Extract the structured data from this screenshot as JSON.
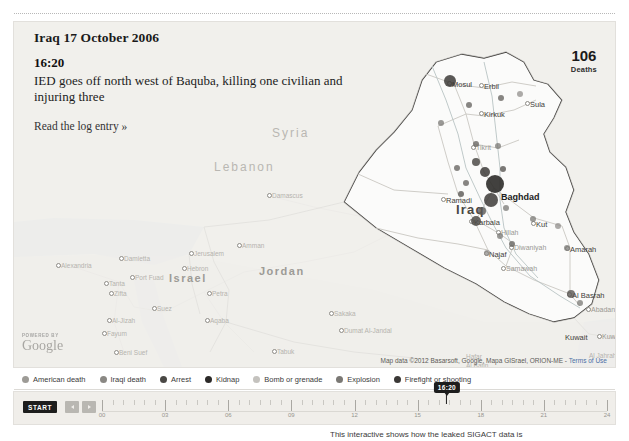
{
  "header": {
    "title": "Iraq 17 October 2006",
    "time": "16:20",
    "description": "IED goes off north west of Baquba, killing one civilian and injuring three",
    "link_label": "Read the log entry »"
  },
  "counter": {
    "value": "106",
    "label": "Deaths"
  },
  "map": {
    "attribution": "Map data ©2012 Basarsoft, Google, Mapa GISrael, ORION-ME",
    "terms_label": "Terms of Use",
    "google_powered_by": "POWERED BY",
    "google_wordmark": "Google",
    "countries": [
      {
        "name": "Syria",
        "x": 258,
        "y": 104,
        "style": "country-faint"
      },
      {
        "name": "Lebanon",
        "x": 200,
        "y": 138,
        "style": "country-faint"
      },
      {
        "name": "Israel",
        "x": 155,
        "y": 250,
        "style": "country-mid"
      },
      {
        "name": "Jordan",
        "x": 245,
        "y": 243,
        "style": "country-mid"
      },
      {
        "name": "Iraq",
        "x": 442,
        "y": 180,
        "style": "country-dark"
      },
      {
        "name": "Kuwait",
        "x": 551,
        "y": 311,
        "style": "city-dark"
      }
    ],
    "cities": [
      {
        "name": "Mosul",
        "x": 438,
        "y": 58,
        "style": "city-dark",
        "dot": true
      },
      {
        "name": "Erbil",
        "x": 470,
        "y": 60,
        "style": "city-dark",
        "dot": true
      },
      {
        "name": "Sula",
        "x": 516,
        "y": 78,
        "style": "city-dark",
        "dot": true
      },
      {
        "name": "Kirkuk",
        "x": 470,
        "y": 88,
        "style": "city-dark",
        "dot": true
      },
      {
        "name": "Tikrit",
        "x": 462,
        "y": 122,
        "style": "city-mid",
        "dot": true
      },
      {
        "name": "Baghdad",
        "x": 487,
        "y": 170,
        "style": "city-big",
        "dot": false
      },
      {
        "name": "Ramadi",
        "x": 432,
        "y": 174,
        "style": "city-dark",
        "dot": true
      },
      {
        "name": "Karbala",
        "x": 460,
        "y": 196,
        "style": "city-dark",
        "dot": true
      },
      {
        "name": "Hillah",
        "x": 487,
        "y": 207,
        "style": "city-mid",
        "dot": true
      },
      {
        "name": "Kut",
        "x": 522,
        "y": 198,
        "style": "city-dark",
        "dot": true
      },
      {
        "name": "Diwaniyah",
        "x": 500,
        "y": 222,
        "style": "city-mid",
        "dot": true
      },
      {
        "name": "Najaf",
        "x": 475,
        "y": 228,
        "style": "city-dark",
        "dot": true
      },
      {
        "name": "Samawah",
        "x": 492,
        "y": 243,
        "style": "city-mid",
        "dot": true
      },
      {
        "name": "Amarah",
        "x": 556,
        "y": 223,
        "style": "city-dark",
        "dot": true
      },
      {
        "name": "Al Basrah",
        "x": 558,
        "y": 269,
        "style": "city-dark",
        "dot": true
      },
      {
        "name": "Abadan",
        "x": 577,
        "y": 284,
        "style": "city-mid",
        "dot": true
      },
      {
        "name": "Kuwa",
        "x": 588,
        "y": 311,
        "style": "city-mid",
        "dot": true
      },
      {
        "name": "Damascus",
        "x": 258,
        "y": 170,
        "style": "city-faint",
        "dot": true
      },
      {
        "name": "Amman",
        "x": 228,
        "y": 220,
        "style": "city-faint",
        "dot": true
      },
      {
        "name": "Jerusalem",
        "x": 180,
        "y": 228,
        "style": "city-faint",
        "dot": true
      },
      {
        "name": "Hebron",
        "x": 173,
        "y": 243,
        "style": "city-faint",
        "dot": true
      },
      {
        "name": "Petra",
        "x": 198,
        "y": 268,
        "style": "city-faint",
        "dot": true
      },
      {
        "name": "Aqaba",
        "x": 196,
        "y": 295,
        "style": "city-faint",
        "dot": true
      },
      {
        "name": "Alexandria",
        "x": 47,
        "y": 240,
        "style": "city-faint",
        "dot": true
      },
      {
        "name": "Damietta",
        "x": 110,
        "y": 233,
        "style": "city-faint",
        "dot": true
      },
      {
        "name": "Port Fuad",
        "x": 121,
        "y": 252,
        "style": "city-faint",
        "dot": true
      },
      {
        "name": "Tanta",
        "x": 95,
        "y": 258,
        "style": "city-faint",
        "dot": true
      },
      {
        "name": "Zifta",
        "x": 100,
        "y": 268,
        "style": "city-faint",
        "dot": true
      },
      {
        "name": "Suez",
        "x": 143,
        "y": 283,
        "style": "city-faint",
        "dot": true
      },
      {
        "name": "Al-Jizah",
        "x": 98,
        "y": 295,
        "style": "city-faint",
        "dot": true
      },
      {
        "name": "Fayum",
        "x": 93,
        "y": 308,
        "style": "city-faint",
        "dot": true
      },
      {
        "name": "Beni Suef",
        "x": 105,
        "y": 327,
        "style": "city-faint",
        "dot": true
      },
      {
        "name": "Tabuk",
        "x": 263,
        "y": 326,
        "style": "city-faint",
        "dot": true
      },
      {
        "name": "Dumat Al-Jandal",
        "x": 330,
        "y": 305,
        "style": "city-faint",
        "dot": true
      },
      {
        "name": "Sakaka",
        "x": 320,
        "y": 288,
        "style": "city-faint",
        "dot": true
      },
      {
        "name": "Hafar",
        "x": 452,
        "y": 331,
        "style": "city-faint",
        "dot": false
      },
      {
        "name": "Al Batin",
        "x": 452,
        "y": 340,
        "style": "city-faint",
        "dot": false
      },
      {
        "name": "Al Jahrah",
        "x": 575,
        "y": 330,
        "style": "city-faint",
        "dot": false
      }
    ],
    "incidents": [
      {
        "x": 436,
        "y": 59,
        "r": 6,
        "shade": "#3d3b38",
        "o": 0.85
      },
      {
        "x": 455,
        "y": 83,
        "r": 3,
        "shade": "#6a6864",
        "o": 0.8
      },
      {
        "x": 487,
        "y": 76,
        "r": 3,
        "shade": "#6a6864",
        "o": 0.8
      },
      {
        "x": 506,
        "y": 72,
        "r": 3,
        "shade": "#8a8884",
        "o": 0.7
      },
      {
        "x": 427,
        "y": 101,
        "r": 3,
        "shade": "#7a7874",
        "o": 0.75
      },
      {
        "x": 462,
        "y": 122,
        "r": 3,
        "shade": "#6a6864",
        "o": 0.8
      },
      {
        "x": 484,
        "y": 124,
        "r": 3,
        "shade": "#7a7874",
        "o": 0.75
      },
      {
        "x": 462,
        "y": 140,
        "r": 4,
        "shade": "#4d4b48",
        "o": 0.85
      },
      {
        "x": 443,
        "y": 146,
        "r": 3,
        "shade": "#6a6864",
        "o": 0.8
      },
      {
        "x": 471,
        "y": 150,
        "r": 5,
        "shade": "#3d3b38",
        "o": 0.85
      },
      {
        "x": 489,
        "y": 147,
        "r": 3,
        "shade": "#5a5854",
        "o": 0.8
      },
      {
        "x": 452,
        "y": 161,
        "r": 3,
        "shade": "#6a6864",
        "o": 0.8
      },
      {
        "x": 481,
        "y": 162,
        "r": 9,
        "shade": "#2e2c2a",
        "o": 0.9
      },
      {
        "x": 447,
        "y": 172,
        "r": 3,
        "shade": "#5a5854",
        "o": 0.8
      },
      {
        "x": 477,
        "y": 178,
        "r": 7,
        "shade": "#3d3b38",
        "o": 0.85
      },
      {
        "x": 468,
        "y": 189,
        "r": 4,
        "shade": "#5a5854",
        "o": 0.8
      },
      {
        "x": 462,
        "y": 199,
        "r": 5,
        "shade": "#4d4b48",
        "o": 0.85
      },
      {
        "x": 492,
        "y": 186,
        "r": 3,
        "shade": "#7a7874",
        "o": 0.75
      },
      {
        "x": 486,
        "y": 214,
        "r": 3,
        "shade": "#7a7874",
        "o": 0.75
      },
      {
        "x": 498,
        "y": 222,
        "r": 3,
        "shade": "#6a6864",
        "o": 0.8
      },
      {
        "x": 473,
        "y": 231,
        "r": 3,
        "shade": "#8a8884",
        "o": 0.7
      },
      {
        "x": 519,
        "y": 197,
        "r": 3,
        "shade": "#7a7874",
        "o": 0.75
      },
      {
        "x": 544,
        "y": 204,
        "r": 3,
        "shade": "#8a8884",
        "o": 0.7
      },
      {
        "x": 553,
        "y": 226,
        "r": 3,
        "shade": "#7a7874",
        "o": 0.75
      },
      {
        "x": 557,
        "y": 272,
        "r": 4,
        "shade": "#5a5854",
        "o": 0.8
      },
      {
        "x": 566,
        "y": 281,
        "r": 3,
        "shade": "#7a7874",
        "o": 0.75
      }
    ]
  },
  "legend": {
    "items": [
      {
        "label": "American death",
        "color": "#9d9b96"
      },
      {
        "label": "Iraqi death",
        "color": "#8a8884"
      },
      {
        "label": "Arrest",
        "color": "#4a4845"
      },
      {
        "label": "Kidnap",
        "color": "#2b2928"
      },
      {
        "label": "Bomb or grenade",
        "color": "#c4c2be"
      },
      {
        "label": "Explosion",
        "color": "#7a7874"
      },
      {
        "label": "Firefight or shooting",
        "color": "#3a3836"
      }
    ]
  },
  "timeline": {
    "start_label": "START",
    "prev_label": "◀",
    "next_label": "▶",
    "marker_label": "16:20",
    "marker_percent": 68.3,
    "tick_labels": [
      "00",
      "03",
      "06",
      "09",
      "12",
      "15",
      "18",
      "21",
      "24"
    ],
    "tick_count": 49
  },
  "caption": {
    "text": "This interactive shows how the leaked SIGACT data is"
  }
}
